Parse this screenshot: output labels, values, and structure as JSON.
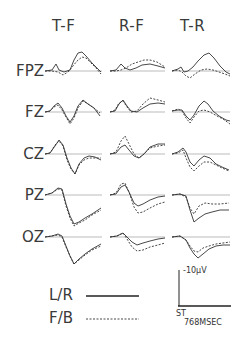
{
  "columns": [
    {
      "label": "T-F"
    },
    {
      "label": "R-F"
    },
    {
      "label": "T-R"
    }
  ],
  "rows": [
    {
      "label": "FPZ"
    },
    {
      "label": "FZ"
    },
    {
      "label": "CZ"
    },
    {
      "label": "PZ"
    },
    {
      "label": "OZ"
    }
  ],
  "legend": {
    "solid": {
      "label": "L/R",
      "style": "solid"
    },
    "dashed": {
      "label": "F/B",
      "style": "dashed"
    }
  },
  "scale": {
    "amplitude_label": "-10µV",
    "stimulus_label": "ST",
    "time_label": "768MSEC"
  },
  "colors": {
    "trace": "#333333",
    "baseline": "#aaaaaa",
    "text": "#3a3a3a"
  }
}
